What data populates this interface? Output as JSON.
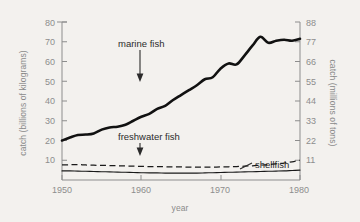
{
  "chart_data": {
    "type": "line",
    "title": "",
    "subtitle": "",
    "xlabel": "year",
    "ylabel": "catch (billions of kilograms)",
    "ylabel_right": "catch (millions of tons)",
    "xlim": [
      1950,
      1980
    ],
    "ylim": [
      0,
      80
    ],
    "ylim_right": [
      0,
      88
    ],
    "grid": false,
    "legend": "annotations-inline",
    "xticks": [
      1950,
      1960,
      1970,
      1980
    ],
    "yticks": [
      10,
      20,
      30,
      40,
      50,
      60,
      70,
      80
    ],
    "yticks_right": [
      11,
      22,
      33,
      44,
      55,
      66,
      77,
      88
    ],
    "x": [
      1950,
      1951,
      1952,
      1953,
      1954,
      1955,
      1956,
      1957,
      1958,
      1959,
      1960,
      1961,
      1962,
      1963,
      1964,
      1965,
      1966,
      1967,
      1968,
      1969,
      1970,
      1971,
      1972,
      1973,
      1974,
      1975,
      1976,
      1977,
      1978,
      1979,
      1980
    ],
    "series": [
      {
        "name": "marine fish",
        "style": "solid-thick",
        "color": "#111111",
        "values": [
          20.0,
          21.5,
          22.8,
          23.0,
          23.6,
          25.5,
          26.6,
          27.0,
          28.0,
          30.0,
          32.0,
          33.5,
          36.0,
          37.5,
          40.5,
          43.0,
          45.5,
          48.0,
          51.0,
          52.0,
          56.5,
          59.0,
          58.5,
          63.0,
          68.0,
          72.5,
          69.5,
          70.5,
          71.0,
          70.5,
          71.5
        ]
      },
      {
        "name": "freshwater fish",
        "style": "dashed",
        "color": "#1a1a1a",
        "values": [
          7.6,
          7.7,
          7.8,
          7.6,
          7.5,
          7.4,
          7.3,
          7.2,
          7.1,
          7.0,
          6.9,
          6.8,
          6.8,
          6.7,
          6.6,
          6.6,
          6.5,
          6.5,
          6.5,
          6.5,
          6.6,
          6.7,
          6.8,
          7.0,
          7.2,
          7.5,
          7.8,
          8.2,
          8.6,
          9.2,
          10.0
        ]
      },
      {
        "name": "shellfish",
        "style": "solid-thin",
        "color": "#1a1a1a",
        "values": [
          4.6,
          4.6,
          4.5,
          4.4,
          4.3,
          4.2,
          4.1,
          4.0,
          3.9,
          3.8,
          3.7,
          3.6,
          3.6,
          3.5,
          3.5,
          3.5,
          3.5,
          3.5,
          3.6,
          3.7,
          3.8,
          3.9,
          4.0,
          4.1,
          4.2,
          4.3,
          4.4,
          4.5,
          4.6,
          4.8,
          5.0
        ]
      }
    ],
    "annotations": [
      {
        "text": "marine fish",
        "points_to": "marine-fish-curve"
      },
      {
        "text": "freshwater fish",
        "points_to": "freshwater-fish-curve"
      },
      {
        "text": "shellfish",
        "points_to": "shellfish-curve"
      }
    ],
    "colors": {
      "background": "#f3f1ee",
      "axis": "#8d8d8d",
      "line": "#111111"
    }
  }
}
